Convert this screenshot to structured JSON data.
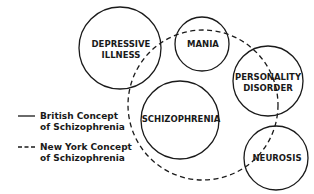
{
  "diagram": {
    "type": "venn-overlap",
    "circles": [
      {
        "id": "depressive",
        "label_lines": [
          "DEPRESSIVE",
          "ILLNESS"
        ],
        "cx": 120,
        "cy": 48,
        "r": 41,
        "style": "solid"
      },
      {
        "id": "mania",
        "label_lines": [
          "MANIA"
        ],
        "cx": 202,
        "cy": 44,
        "r": 27,
        "style": "solid"
      },
      {
        "id": "personality",
        "label_lines": [
          "PERSONALITY",
          "DISORDER"
        ],
        "cx": 268,
        "cy": 81,
        "r": 35,
        "style": "solid"
      },
      {
        "id": "schizophrenia",
        "label_lines": [
          "SCHIZOPHRENIA"
        ],
        "cx": 180,
        "cy": 120,
        "r": 39,
        "style": "solid"
      },
      {
        "id": "neurosis",
        "label_lines": [
          "NEUROSIS"
        ],
        "cx": 276,
        "cy": 158,
        "r": 32,
        "style": "solid"
      },
      {
        "id": "newyork",
        "label_lines": [],
        "cx": 203,
        "cy": 105,
        "r": 75,
        "style": "dashed"
      }
    ],
    "legend": [
      {
        "style": "solid",
        "line1": "British Concept",
        "line2": "of Schizophrenia"
      },
      {
        "style": "dashed",
        "line1": "New York Concept",
        "line2": "of Schizophrenia"
      }
    ],
    "colors": {
      "stroke": "#1a1a1a",
      "background": "#ffffff"
    }
  }
}
